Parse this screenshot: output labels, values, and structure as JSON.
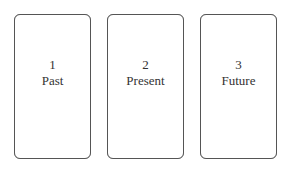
{
  "cards": [
    {
      "number": "1",
      "label": "Past"
    },
    {
      "number": "2",
      "label": "Present"
    },
    {
      "number": "3",
      "label": "Future"
    }
  ]
}
